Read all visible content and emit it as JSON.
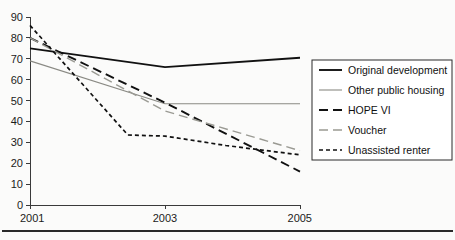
{
  "chart_data": {
    "type": "line",
    "title": "",
    "subtitle": "",
    "xlabel": "",
    "ylabel": "",
    "x": [
      2001,
      2003,
      2005
    ],
    "xtick_labels": [
      "2001",
      "2003",
      "2005"
    ],
    "ytick_labels": [
      "0",
      "10",
      "20",
      "30",
      "40",
      "50",
      "60",
      "70",
      "80",
      "90"
    ],
    "ytick_values": [
      0,
      10,
      20,
      30,
      40,
      50,
      60,
      70,
      80,
      90
    ],
    "ylim": [
      0,
      90
    ],
    "xlim": [
      2001,
      2005
    ],
    "grid": false,
    "legend_position": "right",
    "series": [
      {
        "name": "Original development",
        "values": [
          75,
          66,
          70.5
        ],
        "style": "solid",
        "color": "#111111",
        "width": 1.9
      },
      {
        "name": "Other public housing",
        "values": [
          69,
          48.5,
          48.5
        ],
        "style": "solid",
        "color": "#8a8a84",
        "width": 1.1
      },
      {
        "name": "HOPE VI",
        "values": [
          80,
          49,
          16
        ],
        "style": "long-dash",
        "color": "#111111",
        "width": 1.9
      },
      {
        "name": "Voucher",
        "values": [
          80,
          45,
          26
        ],
        "style": "long-dash",
        "color": "#9a9a93",
        "width": 1.4
      },
      {
        "name": "Unassisted renter",
        "values": [
          86,
          33,
          24
        ],
        "style": "dotted",
        "color": "#111111",
        "width": 1.7,
        "extra_points": [
          {
            "x": 2002.45,
            "y": 33.5
          },
          {
            "x": 2003.9,
            "y": 28.5
          }
        ]
      }
    ]
  },
  "legend": {
    "entries": [
      {
        "label": "Original development"
      },
      {
        "label": "Other public housing"
      },
      {
        "label": "HOPE VI"
      },
      {
        "label": "Voucher"
      },
      {
        "label": "Unassisted renter"
      }
    ]
  },
  "colors": {
    "ink": "#111111",
    "gray_line": "#8a8a84",
    "axis": "#3a3a3a",
    "page_background": "#fbfbfa",
    "legend_border": "#2b2b2b",
    "footer_rule": "#2a2a2a"
  }
}
